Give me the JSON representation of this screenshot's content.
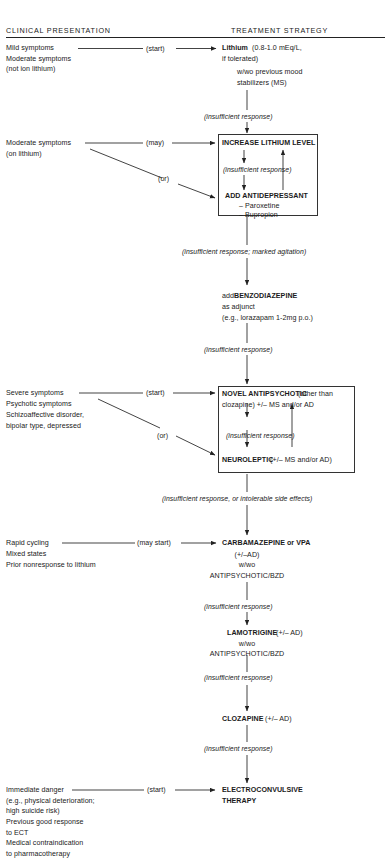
{
  "diagram": {
    "title_columns": {
      "left": "CLINICAL PRESENTATION",
      "right": "TREATMENT STRATEGY"
    },
    "edge_labels": {
      "start": "(start)",
      "may": "(may)",
      "or": "(or)",
      "may_start": "(may start)",
      "insufficient": "(insufficient response)",
      "insufficient_agitation": "(insufficient response; marked agitation)",
      "insufficient_side_effects": "(insufficient response, or intolerable side effects)"
    },
    "stages": [
      {
        "id": "lithium",
        "presentation": [
          "Mild symptoms",
          "Moderate symptoms",
          "(not ion lithium)"
        ],
        "connector": "(start)",
        "treatment_bold": "Lithium",
        "treatment_lines": [
          " (0.8-1.0 mEq/L,",
          "if tolerated)",
          "w/wo previous mood",
          "stabilizers (MS)"
        ],
        "outcome": "(insufficient response)"
      },
      {
        "id": "increase-lithium",
        "presentation": [
          "Moderate symptoms",
          "(on lithium)"
        ],
        "connector_may": "(may)",
        "connector_or": "(or)",
        "boxed": true,
        "box_top_bold": "INCREASE LITHIUM LEVEL",
        "box_middle_italic": "(insufficient response)",
        "box_bottom_bold": "ADD ANTIDEPRESSANT",
        "box_bottom_items": [
          "– Paroxetine",
          "– Bupropion"
        ],
        "outcome": "(insufficient response; marked agitation)"
      },
      {
        "id": "benzodiazepine",
        "presentation": [],
        "treatment_lines": [
          "add BENZODIAZEPINE",
          "as adjunct",
          "(e.g., lorazapam 1-2mg p.o.)"
        ],
        "treatment_prefix": "add ",
        "treatment_bold": "BENZODIAZEPINE",
        "outcome": "(insufficient response)"
      },
      {
        "id": "novel-antipsychotic",
        "presentation": [
          "Severe symptoms",
          "Psychotic symptoms",
          "Schizoaffective disorder,",
          "bipolar type, depressed"
        ],
        "connector_start": "(start)",
        "connector_or": "(or)",
        "boxed": true,
        "box_top_bold": "NOVEL ANTIPSYCHOTIC",
        "box_top_rest_1": " (other than",
        "box_top_rest_2": "clozapine) +/– MS and/or AD",
        "box_middle_italic": "(insufficient response)",
        "box_bottom_bold": "NEUROLEPTIC",
        "box_bottom_rest": " (+/– MS and/or AD)",
        "outcome": "(insufficient response, or intolerable side effects)"
      },
      {
        "id": "carbamazepine",
        "presentation": [
          "Rapid cycling",
          "Mixed states",
          "Prior nonresponse to lithium"
        ],
        "connector": "(may start)",
        "treatment_bold": "CARBAMAZEPINE or VPA",
        "treatment_lines": [
          "(+/–AD)",
          "w/wo",
          "ANTIPSYCHOTIC/BZD"
        ],
        "outcome": "(insufficient response)"
      },
      {
        "id": "lamotrigine",
        "presentation": [],
        "treatment_bold": "LAMOTRIGINE",
        "treatment_bold_rest": " (+/– AD)",
        "treatment_lines": [
          "w/wo",
          "ANTIPSYCHOTIC/BZD"
        ],
        "outcome": "(insufficient response)"
      },
      {
        "id": "clozapine",
        "presentation": [],
        "treatment_bold": "CLOZAPINE",
        "treatment_bold_rest": " (+/– AD)",
        "treatment_lines": [],
        "outcome": "(insufficient response)"
      },
      {
        "id": "ect",
        "presentation": [
          "Immediate danger",
          "(e.g., physical deterioration;",
          "high suicide risk)",
          "Previous good response",
          "to ECT",
          "Medical contraindication",
          "to pharmacotherapy"
        ],
        "connector": "(start)",
        "treatment_bold": "ELECTROCONVULSIVE",
        "treatment_bold_2": "THERAPY",
        "treatment_lines": []
      }
    ]
  }
}
